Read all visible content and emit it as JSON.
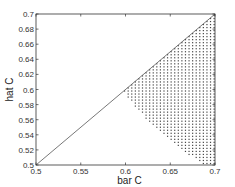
{
  "chart_data": {
    "type": "scatter",
    "title": "",
    "xlabel": "bar C",
    "ylabel": "hat C",
    "xlim": [
      0.5,
      0.7
    ],
    "ylim": [
      0.5,
      0.7
    ],
    "grid": false,
    "x_ticks": [
      "0.5",
      "0.55",
      "0.6",
      "0.65",
      "0.7"
    ],
    "y_ticks": [
      "0.5",
      "0.52",
      "0.54",
      "0.56",
      "0.58",
      "0.6",
      "0.62",
      "0.64",
      "0.66",
      "0.68",
      "0.7"
    ],
    "series": [
      {
        "name": "diagonal",
        "kind": "line",
        "x": [
          0.5,
          0.7
        ],
        "y": [
          0.5,
          0.7
        ],
        "color": "#555555"
      },
      {
        "name": "feasible-region",
        "kind": "dot-fill",
        "description": "dotted region below the diagonal, right of a curved boundary from (0.598,0.598) to (0.69,0.5), bounded by x=0.7",
        "boundary_curve": {
          "x": [
            0.598,
            0.605,
            0.615,
            0.625,
            0.635,
            0.645,
            0.655,
            0.665,
            0.675,
            0.685,
            0.69
          ],
          "y": [
            0.598,
            0.585,
            0.571,
            0.559,
            0.548,
            0.537,
            0.527,
            0.518,
            0.51,
            0.503,
            0.5
          ]
        },
        "dot_spacing": 0.004,
        "color": "#444444"
      }
    ]
  }
}
